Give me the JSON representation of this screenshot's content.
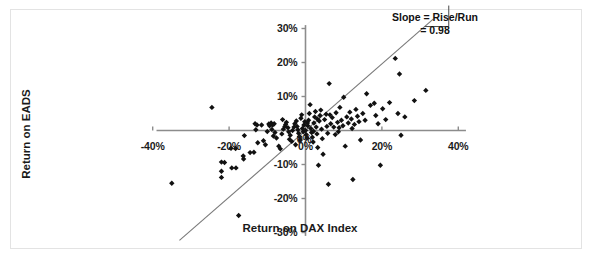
{
  "chart_data": {
    "type": "scatter",
    "title": "",
    "xlabel": "Return on DAX Index",
    "ylabel": "Return on EADS",
    "xlim": [
      -45,
      45
    ],
    "ylim": [
      -33,
      33
    ],
    "xticks": [
      -40,
      -20,
      0,
      20,
      40
    ],
    "xtick_labels": [
      "-40%",
      "-20%",
      "0%",
      "20%",
      "40%"
    ],
    "yticks": [
      -30,
      -20,
      -10,
      0,
      10,
      20,
      30
    ],
    "ytick_labels": [
      "-30%",
      "-20%",
      "-10%",
      "0%",
      "10%",
      "20%",
      "30%"
    ],
    "grid": false,
    "legend": null,
    "marker": "diamond",
    "marker_color": "#111111",
    "axis_color": "#8c8c8c",
    "trendline": {
      "slope": 0.98,
      "intercept": 0.0,
      "color": "#7a7a7a",
      "x_start": -33.0,
      "x_end": 33.5
    },
    "annotation": {
      "line1": "Slope = Rise/Run",
      "line2": "= 0.98",
      "triangle": true
    },
    "points": [
      [
        -35.0,
        -15.5
      ],
      [
        -24.5,
        6.8
      ],
      [
        -22.0,
        -9.3
      ],
      [
        -21.2,
        -9.4
      ],
      [
        -22.0,
        -12.0
      ],
      [
        -22.0,
        -13.8
      ],
      [
        -19.3,
        -11.0
      ],
      [
        -18.2,
        -11.0
      ],
      [
        -19.5,
        -5.2
      ],
      [
        -18.3,
        -5.3
      ],
      [
        -17.5,
        -25.0
      ],
      [
        -16.0,
        -1.5
      ],
      [
        -16.3,
        -7.5
      ],
      [
        -16.2,
        -8.4
      ],
      [
        -14.5,
        -6.5
      ],
      [
        -13.5,
        -6.4
      ],
      [
        -13.0,
        0.2
      ],
      [
        -12.7,
        1.6
      ],
      [
        -11.5,
        1.6
      ],
      [
        -12.5,
        -3.6
      ],
      [
        -11.0,
        -3.0
      ],
      [
        -10.5,
        -4.2
      ],
      [
        -10.0,
        -0.3
      ],
      [
        -9.6,
        1.9
      ],
      [
        -9.0,
        2.2
      ],
      [
        -9.4,
        1.4
      ],
      [
        -8.6,
        1.6
      ],
      [
        -8.2,
        2.0
      ],
      [
        -8.8,
        0.3
      ],
      [
        -8.0,
        -0.6
      ],
      [
        -8.4,
        -1.6
      ],
      [
        -7.6,
        -2.2
      ],
      [
        -7.0,
        -4.6
      ],
      [
        -6.6,
        -5.4
      ],
      [
        -6.2,
        -1.0
      ],
      [
        -5.8,
        0.4
      ],
      [
        -5.4,
        1.2
      ],
      [
        -5.0,
        2.4
      ],
      [
        -5.2,
        1.8
      ],
      [
        -4.6,
        0.8
      ],
      [
        -4.4,
        -0.4
      ],
      [
        -4.0,
        -1.4
      ],
      [
        -4.2,
        -2.6
      ],
      [
        -3.6,
        -3.2
      ],
      [
        -3.4,
        0.0
      ],
      [
        -3.0,
        1.0
      ],
      [
        -2.8,
        2.0
      ],
      [
        -2.4,
        2.8
      ],
      [
        -2.2,
        1.2
      ],
      [
        -2.0,
        0.2
      ],
      [
        -1.8,
        -0.8
      ],
      [
        -1.6,
        -1.8
      ],
      [
        -1.4,
        -2.8
      ],
      [
        -1.2,
        3.6
      ],
      [
        -1.0,
        4.6
      ],
      [
        -0.8,
        0.6
      ],
      [
        -0.6,
        -0.4
      ],
      [
        -0.4,
        1.6
      ],
      [
        -0.2,
        2.6
      ],
      [
        0.0,
        0.0
      ],
      [
        0.2,
        -1.2
      ],
      [
        0.4,
        -2.2
      ],
      [
        0.6,
        1.4
      ],
      [
        0.8,
        3.0
      ],
      [
        1.0,
        5.0
      ],
      [
        1.2,
        7.6
      ],
      [
        1.4,
        0.6
      ],
      [
        1.6,
        -0.6
      ],
      [
        1.8,
        -2.0
      ],
      [
        2.0,
        -3.4
      ],
      [
        2.2,
        2.2
      ],
      [
        2.4,
        4.0
      ],
      [
        2.6,
        5.6
      ],
      [
        2.8,
        1.0
      ],
      [
        3.0,
        -1.0
      ],
      [
        3.2,
        -5.0
      ],
      [
        3.4,
        -10.2
      ],
      [
        3.6,
        2.8
      ],
      [
        3.8,
        4.4
      ],
      [
        4.0,
        6.0
      ],
      [
        4.2,
        0.4
      ],
      [
        4.4,
        -2.4
      ],
      [
        4.6,
        -7.0
      ],
      [
        5.0,
        3.2
      ],
      [
        5.4,
        4.8
      ],
      [
        5.6,
        1.2
      ],
      [
        5.8,
        -0.8
      ],
      [
        6.0,
        -15.8
      ],
      [
        6.2,
        13.8
      ],
      [
        6.6,
        2.0
      ],
      [
        7.0,
        3.8
      ],
      [
        7.4,
        1.0
      ],
      [
        7.8,
        -1.2
      ],
      [
        8.0,
        5.2
      ],
      [
        8.4,
        2.4
      ],
      [
        8.8,
        0.8
      ],
      [
        9.0,
        6.8
      ],
      [
        9.4,
        3.0
      ],
      [
        9.8,
        1.4
      ],
      [
        10.0,
        9.8
      ],
      [
        10.4,
        -4.6
      ],
      [
        10.8,
        4.0
      ],
      [
        11.2,
        2.2
      ],
      [
        11.6,
        5.4
      ],
      [
        12.0,
        3.4
      ],
      [
        12.4,
        -14.4
      ],
      [
        12.8,
        1.8
      ],
      [
        13.2,
        6.2
      ],
      [
        13.6,
        4.2
      ],
      [
        14.0,
        2.6
      ],
      [
        14.4,
        -2.8
      ],
      [
        15.0,
        5.0
      ],
      [
        15.6,
        3.0
      ],
      [
        16.0,
        10.8
      ],
      [
        17.0,
        7.4
      ],
      [
        18.0,
        8.0
      ],
      [
        18.4,
        4.4
      ],
      [
        19.0,
        2.0
      ],
      [
        19.6,
        -10.2
      ],
      [
        20.2,
        6.4
      ],
      [
        21.0,
        3.2
      ],
      [
        22.0,
        8.2
      ],
      [
        23.5,
        21.2
      ],
      [
        24.2,
        5.0
      ],
      [
        24.6,
        16.6
      ],
      [
        25.0,
        -1.4
      ],
      [
        26.0,
        4.0
      ],
      [
        28.5,
        8.8
      ],
      [
        31.5,
        11.8
      ],
      [
        -13.2,
        2.0
      ],
      [
        -6.0,
        3.2
      ],
      [
        -2.6,
        -4.2
      ],
      [
        0.5,
        2.2
      ],
      [
        2.1,
        -0.2
      ],
      [
        3.1,
        3.4
      ],
      [
        6.4,
        4.6
      ],
      [
        8.6,
        -0.4
      ],
      [
        12.2,
        0.6
      ]
    ]
  }
}
